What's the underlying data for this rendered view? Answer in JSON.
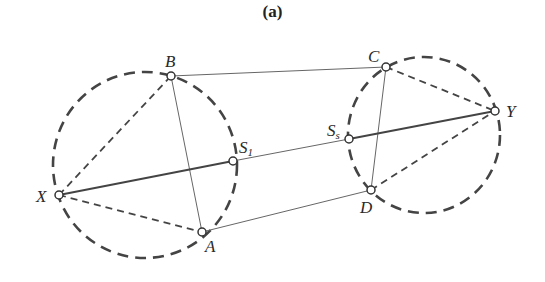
{
  "figure": {
    "title": "(a)"
  },
  "diagram": {
    "points": [
      {
        "id": "B",
        "label": "B",
        "x": 171,
        "y": 76
      },
      {
        "id": "C",
        "label": "C",
        "x": 386,
        "y": 67
      },
      {
        "id": "Y",
        "label": "Y",
        "x": 495,
        "y": 111
      },
      {
        "id": "Ss",
        "label": "S",
        "sub": "s",
        "x": 349,
        "y": 139
      },
      {
        "id": "S1",
        "label": "S",
        "sub": "1",
        "x": 233,
        "y": 161
      },
      {
        "id": "X",
        "label": "X",
        "x": 59,
        "y": 195
      },
      {
        "id": "A",
        "label": "A",
        "x": 202,
        "y": 232
      },
      {
        "id": "D",
        "label": "D",
        "x": 371,
        "y": 190
      }
    ],
    "circles": [
      {
        "name": "left-circle",
        "cx": 145,
        "cy": 165,
        "rx": 92,
        "ry": 93,
        "style": "dashed"
      },
      {
        "name": "right-circle",
        "cx": 424,
        "cy": 135,
        "rx": 76,
        "ry": 78,
        "style": "dashed"
      }
    ],
    "solid_lines": [
      [
        "B",
        "C"
      ],
      [
        "B",
        "A"
      ],
      [
        "C",
        "D"
      ],
      [
        "A",
        "D"
      ],
      [
        "X",
        "S1"
      ],
      [
        "S1",
        "Ss"
      ],
      [
        "Ss",
        "Y"
      ]
    ],
    "dashed_lines": [
      [
        "X",
        "B"
      ],
      [
        "X",
        "A"
      ],
      [
        "C",
        "Y"
      ],
      [
        "D",
        "Y"
      ]
    ],
    "colors": {
      "line": "#555555",
      "thick_line": "#444444",
      "circle": "#444444",
      "point_fill": "#ffffff"
    }
  }
}
